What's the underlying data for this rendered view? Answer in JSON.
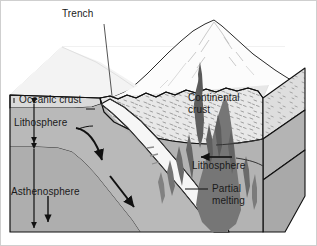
{
  "figure": {
    "kind": "geology-block-diagram",
    "background_color": "#ffffff"
  },
  "labels": {
    "trench": "Trench",
    "oceanic_crust": "Oceanic crust",
    "continental_crust_line1": "Continental",
    "continental_crust_line2": "crust",
    "lithosphere_left": "Lithosphere",
    "lithosphere_right": "Lithosphere",
    "asthenosphere": "Asthenosphere",
    "partial_melting_line1": "Partial",
    "partial_melting_line2": "melting"
  },
  "colors": {
    "outline": "#111111",
    "text": "#1a1a1a",
    "sea_surface": "#e2e2e2",
    "oceanic_crust_fill": "#d9d9d9",
    "lithosphere_fill": "#b8b8b8",
    "asthenosphere_fill": "#b0b0b0",
    "continental_crust_fill": "#e6e6e6",
    "side_face_fill": "#a8a8a8",
    "slab_band_fill": "#f4f4f4",
    "melt_plume_fill": "#6f6f6f",
    "mountain_fill": "#fbfbfb"
  },
  "annotations": {
    "lithosphere_thickness_arrow": "double-headed-vertical-arrow",
    "asthenosphere_thickness_arrow": "double-headed-vertical-arrow",
    "plate_motion_left_arrow": "curved-down-right-arrow",
    "mantle_flow_arrow": "down-right-arrow",
    "asthenosphere_down_arrow": "down-arrow",
    "continental_motion_arrow": "left-arrow",
    "trench_leader": "leader-line",
    "partial_melting_leader": "leader-line",
    "lithosphere_leader": "leader-line",
    "oceanic_crust_leader": "leader-line"
  }
}
